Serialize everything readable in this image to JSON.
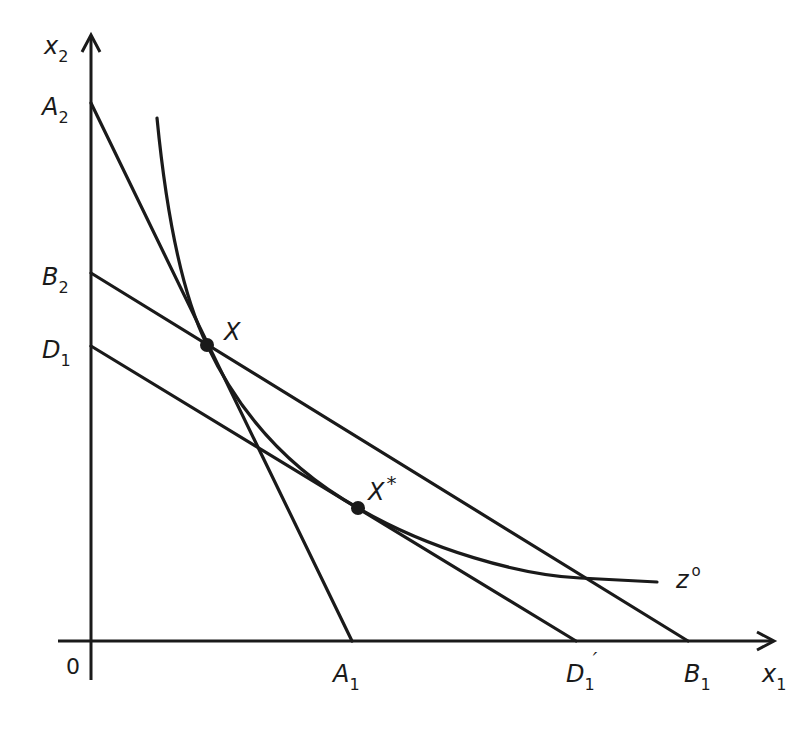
{
  "diagram": {
    "axes": {
      "x_label": "x",
      "x_sub": "1",
      "y_label": "x",
      "y_sub": "2",
      "origin_label": "0"
    },
    "intercepts": {
      "A2": {
        "base": "A",
        "sub": "2"
      },
      "B2": {
        "base": "B",
        "sub": "2"
      },
      "D1": {
        "base": "D",
        "sub": "1"
      },
      "A1": {
        "base": "A",
        "sub": "1"
      },
      "D1_prime": {
        "base": "D",
        "sub": "1",
        "prime": "′"
      },
      "B1": {
        "base": "B",
        "sub": "1"
      }
    },
    "points": {
      "X": {
        "label": "X"
      },
      "X_star": {
        "label": "X",
        "sup": "*"
      }
    },
    "curve": {
      "label": "z",
      "sup": "o"
    },
    "lines": [
      {
        "name": "A2-A1",
        "from": "A2",
        "to": "A1"
      },
      {
        "name": "B2-B1",
        "from": "B2",
        "to": "B1"
      },
      {
        "name": "D1-D1prime",
        "from": "D1",
        "to": "D1'"
      }
    ]
  }
}
